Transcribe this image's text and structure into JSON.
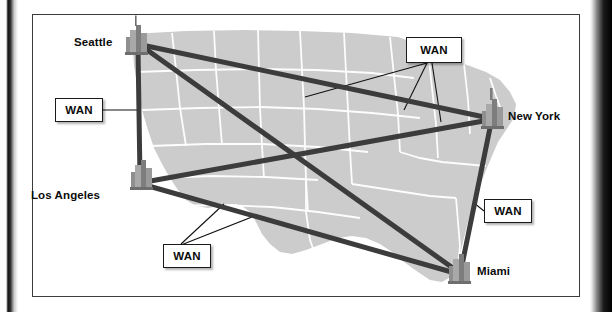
{
  "figure": {
    "type": "network-topology-map",
    "region_label": "United States map",
    "map_fill_color": "#cccccc",
    "map_border_color": "#ffffff",
    "link_color": "#3c3c3c",
    "leader_color": "#111111",
    "frame_color": "#3c3c3c",
    "background_color": "#ffffff"
  },
  "nodes": [
    {
      "id": "seattle",
      "label": "Seattle",
      "icon": "city-buildings-icon",
      "x": 136,
      "y": 43,
      "label_x": 74,
      "label_y": 36,
      "label_align": "right"
    },
    {
      "id": "los-angeles",
      "label": "Los Angeles",
      "icon": "city-buildings-icon",
      "x": 141,
      "y": 182,
      "label_x": 31,
      "label_y": 189,
      "label_align": "right"
    },
    {
      "id": "new-york",
      "label": "New York",
      "icon": "city-buildings-icon",
      "x": 492,
      "y": 117,
      "label_x": 508,
      "label_y": 110,
      "label_align": "left"
    },
    {
      "id": "miami",
      "label": "Miami",
      "icon": "city-buildings-icon",
      "x": 459,
      "y": 274,
      "label_x": 477,
      "label_y": 265,
      "label_align": "left"
    }
  ],
  "links": [
    {
      "id": "seattle-los-angeles",
      "from": "seattle",
      "to": "los-angeles",
      "x1": 138,
      "y1": 48,
      "x2": 140,
      "y2": 178,
      "width": 5
    },
    {
      "id": "seattle-new-york",
      "from": "seattle",
      "to": "new-york",
      "x1": 142,
      "y1": 45,
      "x2": 489,
      "y2": 118,
      "width": 5
    },
    {
      "id": "seattle-miami",
      "from": "seattle",
      "to": "miami",
      "x1": 143,
      "y1": 47,
      "x2": 457,
      "y2": 271,
      "width": 5
    },
    {
      "id": "los-angeles-new-york",
      "from": "los-angeles",
      "to": "new-york",
      "x1": 145,
      "y1": 182,
      "x2": 489,
      "y2": 120,
      "width": 5
    },
    {
      "id": "los-angeles-miami",
      "from": "los-angeles",
      "to": "miami",
      "x1": 145,
      "y1": 185,
      "x2": 455,
      "y2": 273,
      "width": 5
    },
    {
      "id": "new-york-miami",
      "from": "new-york",
      "to": "miami",
      "x1": 491,
      "y1": 123,
      "x2": 461,
      "y2": 270,
      "width": 5
    }
  ],
  "annotations": [
    {
      "id": "wan-top-right",
      "label": "WAN",
      "box": {
        "x": 406,
        "y": 37,
        "w": 56,
        "h": 26
      },
      "anchor": {
        "x": 427,
        "y": 63
      },
      "leaders": [
        {
          "x": 305,
          "y": 97
        },
        {
          "x": 404,
          "y": 110
        },
        {
          "x": 441,
          "y": 122
        }
      ]
    },
    {
      "id": "wan-left",
      "label": "WAN",
      "box": {
        "x": 55,
        "y": 98,
        "w": 48,
        "h": 24
      },
      "anchor": {
        "x": 103,
        "y": 110
      },
      "leaders": [
        {
          "x": 139,
          "y": 110
        }
      ]
    },
    {
      "id": "wan-right",
      "label": "WAN",
      "box": {
        "x": 484,
        "y": 199,
        "w": 48,
        "h": 24
      },
      "anchor": {
        "x": 484,
        "y": 211
      },
      "leaders": [
        {
          "x": 475,
          "y": 201
        }
      ]
    },
    {
      "id": "wan-bottom",
      "label": "WAN",
      "box": {
        "x": 163,
        "y": 244,
        "w": 48,
        "h": 24
      },
      "anchor": {
        "x": 181,
        "y": 244
      },
      "leaders": [
        {
          "x": 224,
          "y": 204
        },
        {
          "x": 255,
          "y": 214
        }
      ]
    }
  ]
}
